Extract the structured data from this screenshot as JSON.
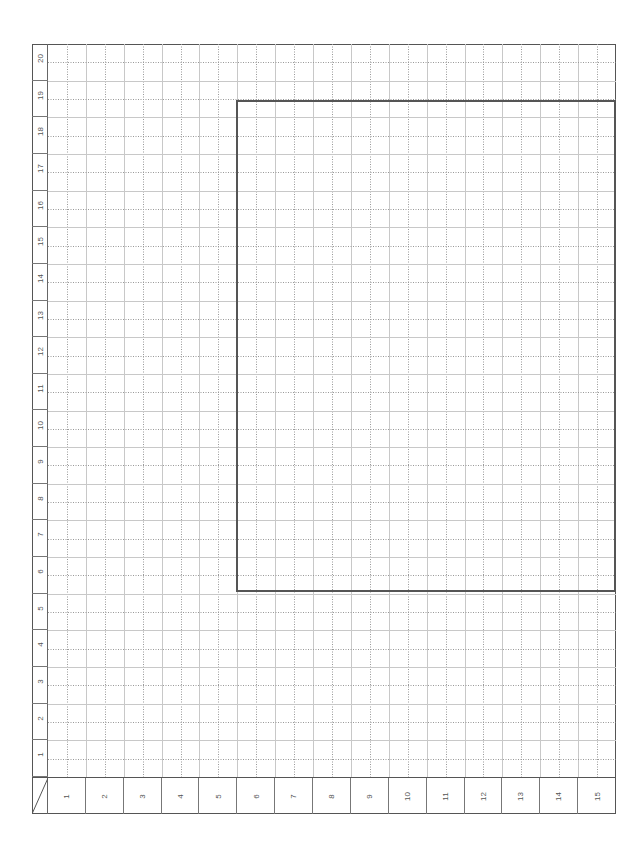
{
  "page": {
    "type": "grid-paper",
    "orientation": "rotated -90deg",
    "colors": {
      "frame": "#555555",
      "solid_grid": "#c8c8c8",
      "dotted_grid": "#999999",
      "label_text": "#555555"
    }
  },
  "row_labels": [
    "20",
    "19",
    "18",
    "17",
    "16",
    "15",
    "14",
    "13",
    "12",
    "11",
    "10",
    "9",
    "8",
    "7",
    "6",
    "5",
    "4",
    "3",
    "2",
    "1"
  ],
  "column_labels": [
    "1",
    "2",
    "3",
    "4",
    "5",
    "6",
    "7",
    "8",
    "9",
    "10",
    "11",
    "12",
    "13",
    "14",
    "15"
  ],
  "grid": {
    "major_rows": 20,
    "major_cols": 15,
    "minor_per_major": 2
  },
  "highlight_rectangle": {
    "from_column": 6,
    "to_column": 15,
    "from_row": 6,
    "to_row": 19
  }
}
